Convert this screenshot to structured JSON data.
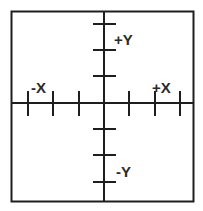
{
  "diagram": {
    "type": "coordinate-axes",
    "frame": {
      "x": 11,
      "y": 11,
      "width": 182,
      "height": 190
    },
    "origin": {
      "x": 104,
      "y": 103
    },
    "colors": {
      "line": "#1e1e1e",
      "label": "#2a2a2a",
      "background": "#ffffff"
    },
    "labels": {
      "pos_y": "+Y",
      "neg_y": "-Y",
      "pos_x": "+X",
      "neg_x": "-X"
    },
    "ticks": {
      "x": [
        28,
        53,
        79,
        129,
        155,
        180
      ],
      "y": [
        24,
        50,
        76,
        129,
        155,
        182
      ]
    }
  }
}
